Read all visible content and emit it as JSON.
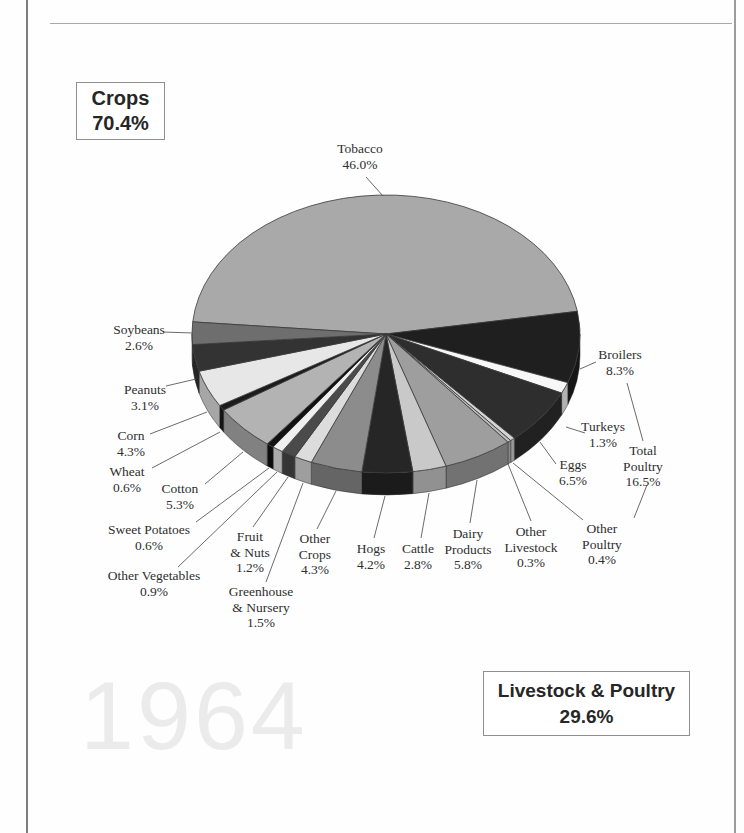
{
  "page": {
    "watermark": "1964",
    "crops_box": {
      "label": "Crops",
      "value": "70.4%"
    },
    "livestock_box": {
      "label": "Livestock & Poultry",
      "value": "29.6%"
    }
  },
  "chart_data": {
    "type": "pie",
    "style": "3d",
    "unit": "percent",
    "start_angle_deg": 175,
    "direction": "clockwise",
    "watermark": "1964",
    "group_totals": [
      {
        "label": "Crops",
        "value": 70.4,
        "display": "70.4%"
      },
      {
        "label": "Livestock & Poultry",
        "value": 29.6,
        "display": "29.6%"
      }
    ],
    "annotations": [
      {
        "id": "total-poultry",
        "lines": [
          "Total",
          "Poultry"
        ],
        "value": 16.5,
        "display": "16.5%"
      }
    ],
    "slices": [
      {
        "id": "tobacco",
        "label": "Tobacco",
        "lines": [
          "Tobacco"
        ],
        "value": 46.0,
        "display": "46.0%",
        "color": "#a9a9a9"
      },
      {
        "id": "broilers",
        "label": "Broilers",
        "lines": [
          "Broilers"
        ],
        "value": 8.3,
        "display": "8.3%",
        "color": "#1f1f1f"
      },
      {
        "id": "turkeys",
        "label": "Turkeys",
        "lines": [
          "Turkeys"
        ],
        "value": 1.3,
        "display": "1.3%",
        "color": "#f7f7f7"
      },
      {
        "id": "eggs",
        "label": "Eggs",
        "lines": [
          "Eggs"
        ],
        "value": 6.5,
        "display": "6.5%",
        "color": "#2e2e2e"
      },
      {
        "id": "other-poultry",
        "label": "Other Poultry",
        "lines": [
          "Other",
          "Poultry"
        ],
        "value": 0.4,
        "display": "0.4%",
        "color": "#d4d4d4"
      },
      {
        "id": "other-livestock",
        "label": "Other Livestock",
        "lines": [
          "Other",
          "Livestock"
        ],
        "value": 0.3,
        "display": "0.3%",
        "color": "#bdbdbd"
      },
      {
        "id": "dairy-products",
        "label": "Dairy Products",
        "lines": [
          "Dairy",
          "Products"
        ],
        "value": 5.8,
        "display": "5.8%",
        "color": "#9e9e9e"
      },
      {
        "id": "cattle",
        "label": "Cattle",
        "lines": [
          "Cattle"
        ],
        "value": 2.8,
        "display": "2.8%",
        "color": "#c9c9c9"
      },
      {
        "id": "hogs",
        "label": "Hogs",
        "lines": [
          "Hogs"
        ],
        "value": 4.2,
        "display": "4.2%",
        "color": "#262626"
      },
      {
        "id": "other-crops",
        "label": "Other Crops",
        "lines": [
          "Other",
          "Crops"
        ],
        "value": 4.3,
        "display": "4.3%",
        "color": "#8c8c8c"
      },
      {
        "id": "greenhouse-nursery",
        "label": "Greenhouse & Nursery",
        "lines": [
          "Greenhouse",
          "& Nursery"
        ],
        "value": 1.5,
        "display": "1.5%",
        "color": "#dcdcdc"
      },
      {
        "id": "fruit-nuts",
        "label": "Fruit & Nuts",
        "lines": [
          "Fruit",
          "& Nuts"
        ],
        "value": 1.2,
        "display": "1.2%",
        "color": "#4a4a4a"
      },
      {
        "id": "other-vegetables",
        "label": "Other Vegetables",
        "lines": [
          "Other Vegetables"
        ],
        "value": 0.9,
        "display": "0.9%",
        "color": "#efefef"
      },
      {
        "id": "sweet-potatoes",
        "label": "Sweet Potatoes",
        "lines": [
          "Sweet Potatoes"
        ],
        "value": 0.6,
        "display": "0.6%",
        "color": "#121212"
      },
      {
        "id": "cotton",
        "label": "Cotton",
        "lines": [
          "Cotton"
        ],
        "value": 5.3,
        "display": "5.3%",
        "color": "#b3b3b3"
      },
      {
        "id": "wheat",
        "label": "Wheat",
        "lines": [
          "Wheat"
        ],
        "value": 0.6,
        "display": "1c",
        "color": "#1c1c1c"
      },
      {
        "id": "corn",
        "label": "Corn",
        "lines": [
          "Corn"
        ],
        "value": 4.3,
        "display": "4.3%",
        "color": "#e7e7e7"
      },
      {
        "id": "peanuts",
        "label": "Peanuts",
        "lines": [
          "Peanuts"
        ],
        "value": 3.1,
        "display": "3.1%",
        "color": "#333333"
      },
      {
        "id": "soybeans",
        "label": "Soybeans",
        "lines": [
          "Soybeans"
        ],
        "value": 2.6,
        "display": "2.6%",
        "color": "#6e6e6e"
      }
    ]
  }
}
